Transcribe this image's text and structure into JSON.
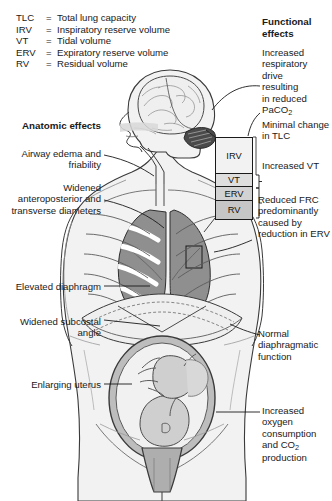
{
  "legend": {
    "rows": [
      {
        "abbr": "TLC",
        "eq": "=",
        "definition": "Total lung capacity"
      },
      {
        "abbr": "IRV",
        "eq": "=",
        "definition": "Inspiratory reserve volume"
      },
      {
        "abbr": "VT",
        "eq": "=",
        "definition": "Tidal volume"
      },
      {
        "abbr": "ERV",
        "eq": "=",
        "definition": "Expiratory reserve volume"
      },
      {
        "abbr": "RV",
        "eq": "=",
        "definition": "Residual volume"
      }
    ]
  },
  "headers": {
    "anatomic": "Anatomic\neffects",
    "functional": "Functional\neffects"
  },
  "anatomic_effects": [
    {
      "id": "airway-edema",
      "text": "Airway edema\nand friability"
    },
    {
      "id": "widened-diameters",
      "text": "Widened\nanteroposterior\nand transverse\ndiameters"
    },
    {
      "id": "elevated-diaphragm",
      "text": "Elevated\ndiaphragm"
    },
    {
      "id": "widened-subcostal-angle",
      "text": "Widened\nsubcostal\nangle"
    },
    {
      "id": "enlarging-uterus",
      "text": "Enlarging\nuterus"
    }
  ],
  "functional_effects": [
    {
      "id": "respiratory-drive",
      "line1": "Increased",
      "line2": "respiratory",
      "line3": "drive",
      "line4": "resulting",
      "line5": "in reduced",
      "line6_pre": "PaCO",
      "line6_sub": "2",
      "line6_post": ""
    },
    {
      "id": "minimal-tlc-change",
      "text": "Minimal\nchange in\nTLC"
    },
    {
      "id": "increased-vt",
      "text": "Increased\nVT"
    },
    {
      "id": "reduced-frc",
      "text": "Reduced\nFRC\npredominantly\ncaused by\nreduction\nin ERV"
    },
    {
      "id": "normal-diaphragmatic-function",
      "text": "Normal\ndiaphragmatic\nfunction"
    },
    {
      "id": "oxygen-consumption",
      "line1": "Increased",
      "line2": "oxygen",
      "line3": "consumption",
      "line4_pre": "and CO",
      "line4_sub": "2",
      "line5": "production"
    }
  ],
  "volume_boxes": [
    {
      "id": "irv",
      "label": "IRV",
      "color": "#f2f2f2"
    },
    {
      "id": "vt",
      "label": "VT",
      "color": "#dedede"
    },
    {
      "id": "erv",
      "label": "ERV",
      "color": "#d2d2d2"
    },
    {
      "id": "rv",
      "label": "RV",
      "color": "#c6c6c6"
    }
  ],
  "figure": {
    "parts": [
      "head-profile",
      "brain",
      "cerebellum",
      "airway",
      "thorax",
      "lungs",
      "ribs",
      "diaphragm",
      "abdomen",
      "uterus",
      "fetus"
    ],
    "colors": {
      "skin": "#f1f1f1",
      "lung": "#9a9a9a",
      "outline": "#2a2a2a",
      "organ": "#c9c9c9"
    }
  }
}
